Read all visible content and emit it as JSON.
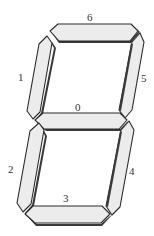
{
  "diagram": {
    "type": "seven-segment-display",
    "segment_fill": "#ececec",
    "segment_stroke": "#2a2a2a",
    "segments": [
      {
        "id": 0,
        "label": "0",
        "position": "middle"
      },
      {
        "id": 1,
        "label": "1",
        "position": "upper-left"
      },
      {
        "id": 2,
        "label": "2",
        "position": "lower-left"
      },
      {
        "id": 3,
        "label": "3",
        "position": "bottom"
      },
      {
        "id": 4,
        "label": "4",
        "position": "lower-right"
      },
      {
        "id": 5,
        "label": "5",
        "position": "upper-right"
      },
      {
        "id": 6,
        "label": "6",
        "position": "top"
      }
    ]
  }
}
